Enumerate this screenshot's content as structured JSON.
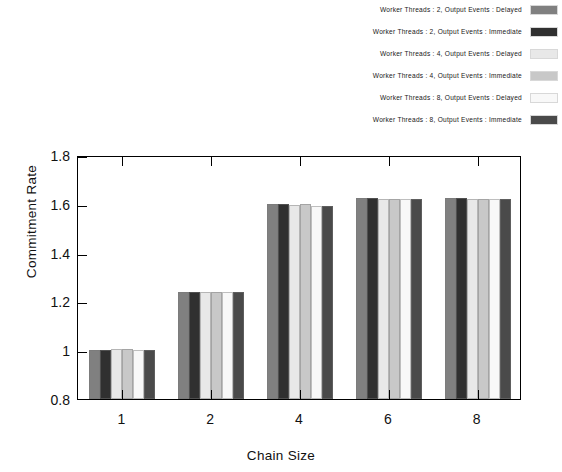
{
  "chart_data": {
    "type": "bar",
    "title": "",
    "xlabel": "Chain Size",
    "ylabel": "Commitment Rate",
    "categories": [
      "1",
      "2",
      "4",
      "6",
      "8"
    ],
    "ylim": [
      0.8,
      1.8
    ],
    "yticks": [
      "0.8",
      "1",
      "1.2",
      "1.4",
      "1.6",
      "1.8"
    ],
    "ytick_values": [
      0.8,
      1.0,
      1.2,
      1.4,
      1.6,
      1.8
    ],
    "grid": false,
    "legend_position": "top-right",
    "series": [
      {
        "name": "Worker Threads : 2, Output Events : Delayed",
        "color": "#808080",
        "values": [
          1.0,
          1.24,
          1.6,
          1.625,
          1.625
        ]
      },
      {
        "name": "Worker Threads : 2, Output Events : Immediate",
        "color": "#303030",
        "values": [
          1.0,
          1.24,
          1.6,
          1.625,
          1.625
        ]
      },
      {
        "name": "Worker Threads : 4, Output Events : Delayed",
        "color": "#e8e8e8",
        "values": [
          1.005,
          1.24,
          1.595,
          1.62,
          1.62
        ]
      },
      {
        "name": "Worker Threads : 4, Output Events : Immediate",
        "color": "#c8c8c8",
        "values": [
          1.005,
          1.24,
          1.6,
          1.62,
          1.62
        ]
      },
      {
        "name": "Worker Threads : 8, Output Events : Delayed",
        "color": "#f8f8f8",
        "values": [
          1.0,
          1.24,
          1.59,
          1.62,
          1.62
        ]
      },
      {
        "name": "Worker Threads : 8, Output Events : Immediate",
        "color": "#4a4a4a",
        "values": [
          1.0,
          1.24,
          1.59,
          1.62,
          1.62
        ]
      }
    ]
  }
}
